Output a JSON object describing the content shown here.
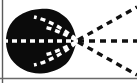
{
  "figure": {
    "title": "Radial dashed-ray scattering diagram",
    "caption": "",
    "canvas": {
      "width": 137,
      "height": 83,
      "background": "#ffffff"
    },
    "colors": {
      "blob_fill": "#0b0b0b",
      "dash_light": "#ffffff",
      "dash_dark": "#111111",
      "border": "#5a5a5a",
      "background": "#ffffff"
    },
    "borders": [
      {
        "name": "left-border-line",
        "orientation": "vertical",
        "x": 2.5,
        "y1": 0,
        "y2": 83,
        "width": 1.4,
        "color": "#5a5a5a"
      },
      {
        "name": "bottom-border-line",
        "orientation": "horizontal",
        "y": 78.5,
        "x1": 0,
        "x2": 137,
        "width": 1.4,
        "color": "#6a6a6a"
      }
    ],
    "blob": {
      "name": "scattering-body",
      "shape": "teardrop-circle",
      "fill": "#0b0b0b",
      "center": {
        "x": 41,
        "y": 41
      },
      "radius_x": 34,
      "radius_y": 32,
      "apex": {
        "x": 77,
        "y": 41
      },
      "path": "M 77 41 C 74 30 72 22 64 16 C 56 9 47 8 40 9 C 28 9.5 16 15 10 25 C 4 35 5 50 11 59 C 18 69 30 74 41 73.5 C 50 73 59 70 66 64 C 72 58 74 50 77 41 Z"
    },
    "apex_point": {
      "name": "convergence-point",
      "x": 77,
      "y": 41
    },
    "interior_dashes": {
      "stroke": "#ffffff",
      "stroke_width": 3.4,
      "dash_pattern": "5 4",
      "curves": [
        {
          "name": "interior-axis-dash",
          "d": "M 3 41 L 77 41"
        },
        {
          "name": "interior-arc-upper-inner",
          "d": "M 76 40 C 64 34 54 29 44 27"
        },
        {
          "name": "interior-arc-upper-outer",
          "d": "M 76 39 C 62 28 48 20 34 17"
        },
        {
          "name": "interior-arc-lower-inner",
          "d": "M 76 42 C 64 48 54 53 44 55"
        },
        {
          "name": "interior-arc-lower-outer",
          "d": "M 76 43 C 62 54 48 62 34 65"
        }
      ]
    },
    "exterior_rays": {
      "stroke": "#111111",
      "stroke_width": 3.4,
      "dash_pattern": "6 5",
      "rays": [
        {
          "name": "ray-upper-diagonal",
          "angle_deg": -29,
          "d": "M 78 40 L 137 7"
        },
        {
          "name": "ray-horizontal",
          "angle_deg": 0,
          "d": "M 78 41 L 137 41"
        },
        {
          "name": "ray-lower-diagonal",
          "angle_deg": 29,
          "d": "M 78 42 L 137 75"
        }
      ]
    },
    "labels": {
      "axis_label": "",
      "legend": []
    }
  },
  "chart_data": {
    "type": "scatter",
    "title": "Radial dashed-ray scattering diagram",
    "xlabel": "",
    "ylabel": "",
    "xlim": [
      0,
      137
    ],
    "ylim": [
      0,
      83
    ],
    "grid": false,
    "legend_position": "none",
    "annotations": [
      "Opaque body occupies left portion of frame",
      "Three dark dashed rays emanate rightward from apex",
      "Four light dashed arcs converge on apex inside body",
      "One light dashed horizontal axis crosses body"
    ],
    "series": [
      {
        "name": "exterior-ray-angles-deg",
        "values": [
          -29,
          0,
          29
        ]
      },
      {
        "name": "apex-coordinates",
        "values": [
          77,
          41
        ]
      }
    ]
  }
}
